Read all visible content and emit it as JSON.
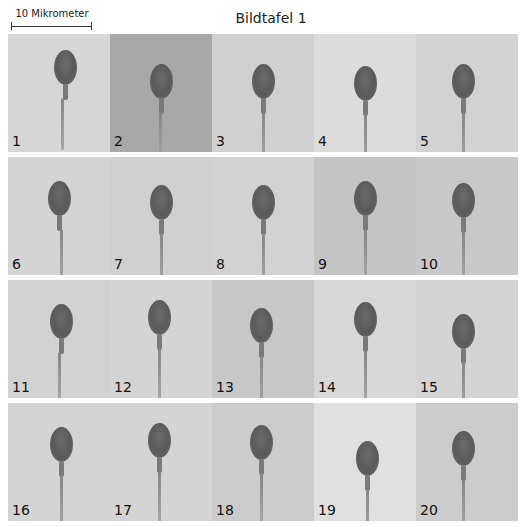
{
  "scale_bar": {
    "label": "10 Mikrometer"
  },
  "title": "Bildtafel 1",
  "panels": [
    {
      "number": "1",
      "bg": "#d6d6d6",
      "head_x": 46,
      "head_y": 16,
      "tail_shift": -3
    },
    {
      "number": "2",
      "bg": "#a8a8a8",
      "head_x": 40,
      "head_y": 30,
      "tail_shift": -1
    },
    {
      "number": "3",
      "bg": "#d0d0d0",
      "head_x": 40,
      "head_y": 30,
      "tail_shift": 0
    },
    {
      "number": "4",
      "bg": "#dcdcdc",
      "head_x": 40,
      "head_y": 32,
      "tail_shift": 0
    },
    {
      "number": "5",
      "bg": "#d2d2d2",
      "head_x": 36,
      "head_y": 30,
      "tail_shift": 0
    },
    {
      "number": "6",
      "bg": "#d4d4d4",
      "head_x": 40,
      "head_y": 24,
      "tail_shift": 2
    },
    {
      "number": "7",
      "bg": "#d0d0d0",
      "head_x": 40,
      "head_y": 28,
      "tail_shift": 0
    },
    {
      "number": "8",
      "bg": "#d2d2d2",
      "head_x": 40,
      "head_y": 28,
      "tail_shift": 0
    },
    {
      "number": "9",
      "bg": "#c4c4c4",
      "head_x": 40,
      "head_y": 24,
      "tail_shift": 0
    },
    {
      "number": "10",
      "bg": "#c8c8c8",
      "head_x": 36,
      "head_y": 26,
      "tail_shift": 0
    },
    {
      "number": "11",
      "bg": "#d2d2d2",
      "head_x": 42,
      "head_y": 24,
      "tail_shift": -2
    },
    {
      "number": "12",
      "bg": "#d4d4d4",
      "head_x": 38,
      "head_y": 20,
      "tail_shift": 0
    },
    {
      "number": "13",
      "bg": "#c8c8c8",
      "head_x": 38,
      "head_y": 28,
      "tail_shift": 0
    },
    {
      "number": "14",
      "bg": "#d8d8d8",
      "head_x": 40,
      "head_y": 22,
      "tail_shift": 0
    },
    {
      "number": "15",
      "bg": "#d4d4d4",
      "head_x": 36,
      "head_y": 34,
      "tail_shift": 0
    },
    {
      "number": "16",
      "bg": "#d4d4d4",
      "head_x": 42,
      "head_y": 24,
      "tail_shift": 0
    },
    {
      "number": "17",
      "bg": "#d4d4d4",
      "head_x": 38,
      "head_y": 20,
      "tail_shift": 0
    },
    {
      "number": "18",
      "bg": "#cccccc",
      "head_x": 38,
      "head_y": 22,
      "tail_shift": 0
    },
    {
      "number": "19",
      "bg": "#e0e0e0",
      "head_x": 42,
      "head_y": 38,
      "tail_shift": 0
    },
    {
      "number": "20",
      "bg": "#cccccc",
      "head_x": 36,
      "head_y": 28,
      "tail_shift": 0
    }
  ]
}
